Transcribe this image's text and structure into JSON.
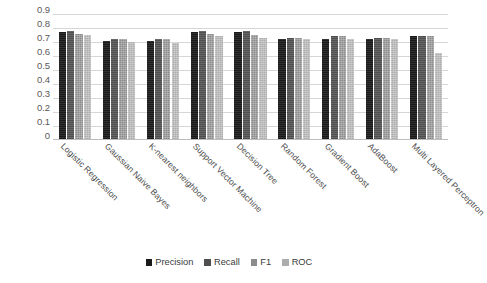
{
  "chart_data": {
    "type": "bar",
    "title": "",
    "subtitle": "",
    "xlabel": "",
    "ylabel": "",
    "ylim": [
      0,
      0.9
    ],
    "grid": true,
    "legend_position": "bottom",
    "y_ticks": [
      "0.9",
      "0.8",
      "0.7",
      "0.6",
      "0.5",
      "0.4",
      "0.3",
      "0.2",
      "0.1",
      "0"
    ],
    "y_tick_values": [
      0.9,
      0.8,
      0.7,
      0.6,
      0.5,
      0.4,
      0.3,
      0.2,
      0.1,
      0
    ],
    "categories": [
      "Logistic Regression",
      "Gaussian Naive Bayes",
      "K-nearest neighbors",
      "Support Vector Machine",
      "Decision Tree",
      "Random Forest",
      "Gradient Boost",
      "AdaBoost",
      "Multi Layered Perceptron"
    ],
    "series": [
      {
        "name": "Precision",
        "color": "#1a1a1a",
        "values": [
          0.77,
          0.71,
          0.71,
          0.77,
          0.77,
          0.72,
          0.72,
          0.72,
          0.74
        ]
      },
      {
        "name": "Recall",
        "color": "#4f4f4f",
        "values": [
          0.78,
          0.72,
          0.72,
          0.78,
          0.78,
          0.73,
          0.74,
          0.73,
          0.74
        ]
      },
      {
        "name": "F1",
        "color": "#8c8c8c",
        "values": [
          0.76,
          0.72,
          0.72,
          0.76,
          0.75,
          0.73,
          0.74,
          0.73,
          0.74
        ]
      },
      {
        "name": "ROC",
        "color": "#adadad",
        "values": [
          0.75,
          0.7,
          0.69,
          0.74,
          0.73,
          0.72,
          0.72,
          0.72,
          0.62
        ]
      }
    ]
  }
}
